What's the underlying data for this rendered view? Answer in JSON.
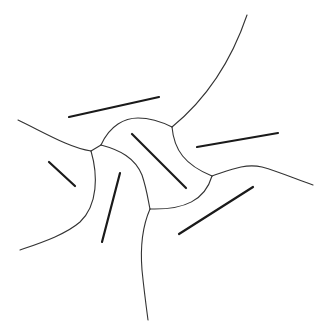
{
  "diagram": {
    "type": "segment-voronoi-diagram",
    "background": "#ffffff",
    "site_color": "#1a1a1a",
    "edge_color": "#333333",
    "sites": [
      {
        "id": "site-top",
        "x1": 69,
        "y1": 117,
        "x2": 159,
        "y2": 97
      },
      {
        "id": "site-right",
        "x1": 197,
        "y1": 147,
        "x2": 278,
        "y2": 133
      },
      {
        "id": "site-center",
        "x1": 132,
        "y1": 134,
        "x2": 186,
        "y2": 188
      },
      {
        "id": "site-left",
        "x1": 49,
        "y1": 162,
        "x2": 75,
        "y2": 186
      },
      {
        "id": "site-lower-left",
        "x1": 120,
        "y1": 173,
        "x2": 102,
        "y2": 242
      },
      {
        "id": "site-lower-right",
        "x1": 179,
        "y1": 234,
        "x2": 253,
        "y2": 187
      }
    ],
    "junctions": [
      {
        "id": "junction-left-a",
        "x": 91,
        "y": 151
      },
      {
        "id": "junction-left-b",
        "x": 101,
        "y": 145
      },
      {
        "id": "junction-top",
        "x": 172,
        "y": 127
      },
      {
        "id": "junction-right",
        "x": 212,
        "y": 176
      },
      {
        "id": "junction-bottom",
        "x": 150,
        "y": 209
      }
    ],
    "edges": [
      {
        "id": "edge-upper-right-ray",
        "d": "M172,127 C205,100 230,65 247,15"
      },
      {
        "id": "edge-top-arc",
        "d": "M101,145 C110,125 125,118 138,118 C152,118 162,122 172,127"
      },
      {
        "id": "edge-left-ray",
        "d": "M18,120 C45,133 70,148 91,151"
      },
      {
        "id": "edge-left-connector",
        "d": "M91,151 L101,145"
      },
      {
        "id": "edge-left-lower-ray",
        "d": "M91,151 C98,175 98,205 80,222 C65,235 40,243 20,250"
      },
      {
        "id": "edge-center-left",
        "d": "M101,145 C120,150 135,158 142,175 C147,190 148,200 150,209"
      },
      {
        "id": "edge-center-right",
        "d": "M172,127 C174,150 185,165 212,176"
      },
      {
        "id": "edge-right-ray",
        "d": "M212,176 C230,170 245,163 262,167 C280,172 298,180 313,185"
      },
      {
        "id": "edge-bottom-arc",
        "d": "M212,176 C205,200 185,210 150,209"
      },
      {
        "id": "edge-bottom-ray",
        "d": "M150,209 C143,225 140,245 142,270 C144,290 146,305 148,320"
      }
    ]
  }
}
